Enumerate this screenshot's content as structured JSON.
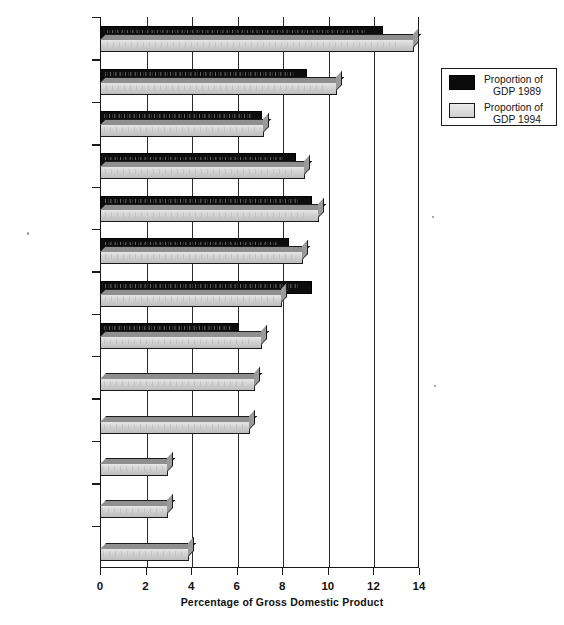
{
  "chart_data": {
    "type": "bar",
    "orientation": "horizontal",
    "title": "",
    "xlabel": "Percentage of Gross Domestic Product",
    "ylabel": "",
    "xlim": [
      0,
      14
    ],
    "xticks": [
      0,
      2,
      4,
      6,
      8,
      10,
      12,
      14
    ],
    "xtick_labels": [
      "0",
      "2",
      "4",
      "6",
      "8",
      "10",
      "12",
      "14"
    ],
    "grid": true,
    "grid_axis": "x",
    "legend_position": "upper right (outside plot)",
    "categories": [
      "United States",
      "Canada",
      "Japan",
      "Germany",
      "France",
      "The Netherlands",
      "Sweden",
      "United Kingdom",
      "Czech Republic",
      "Hungary",
      "Russia",
      "China",
      "Mexico"
    ],
    "series": [
      {
        "name": "Proportion of GDP 1989",
        "style": "dark",
        "values": [
          12.4,
          9.1,
          7.1,
          8.6,
          9.3,
          8.3,
          9.3,
          6.1,
          null,
          null,
          null,
          null,
          null
        ]
      },
      {
        "name": "Proportion of GDP 1994",
        "style": "light",
        "values": [
          13.8,
          10.4,
          7.2,
          9.0,
          9.6,
          8.9,
          8.0,
          7.1,
          6.8,
          6.6,
          3.0,
          3.0,
          3.9
        ]
      }
    ]
  },
  "legend": {
    "items": [
      {
        "line1": "Proportion of",
        "line2": "GDP 1989",
        "swatch": "dark"
      },
      {
        "line1": "Proportion of",
        "line2": "GDP 1994",
        "swatch": "light"
      }
    ]
  },
  "colors": {
    "series_1989": "#0d0d0d",
    "series_1994": "#d2d2d2",
    "axis": "#1a1a1a",
    "grid": "#2b2b2b",
    "background": "#ffffff"
  }
}
